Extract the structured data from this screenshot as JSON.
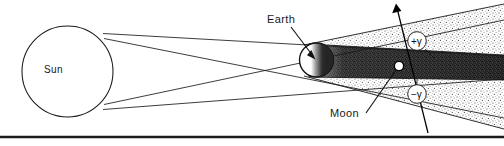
{
  "figure": {
    "bodies": {
      "sun": {
        "label": "Sun",
        "shape": "circle",
        "cx": 67.5,
        "cy": 71.5,
        "r": 45.5,
        "fill": "#ffffff",
        "stroke": "#1a1a1a"
      },
      "earth": {
        "label": "Earth",
        "shape": "circle",
        "cx": 316.5,
        "cy": 60.0,
        "r": 17.0,
        "fill": "#ffffff",
        "stroke": "#111111"
      },
      "moon": {
        "label": "Moon",
        "shape": "circle",
        "cx": 399.0,
        "cy": 66.0,
        "r": 4.6,
        "fill": "#ffffff",
        "stroke": "#000000"
      }
    },
    "shadow": {
      "penumbra_label": "penumbra",
      "umbra_label": "umbra",
      "penumbra_tone": "#8d8d8d",
      "umbra_tone": "#2b2b2b"
    },
    "annotations": [
      {
        "name": "plus-gamma",
        "text": "+γ",
        "cx": 417.0,
        "cy": 41.0
      },
      {
        "name": "minus-gamma",
        "text": "−γ",
        "cx": 417.0,
        "cy": 94.0
      }
    ],
    "orbit": {
      "name": "moon-orbit-line",
      "arrow_direction": "up",
      "from": {
        "x": 428.0,
        "y": 133.0
      },
      "to": {
        "x": 396.0,
        "y": 4.0
      }
    },
    "rule": {
      "name": "bottom-rule",
      "y": 137.0,
      "color": "#1b1b1b",
      "thickness": 2.6
    }
  }
}
